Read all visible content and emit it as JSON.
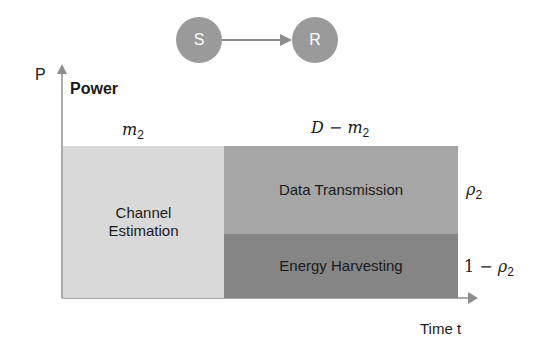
{
  "nodes": {
    "source": "S",
    "relay": "R"
  },
  "axes": {
    "y_symbol": "P",
    "y_label": "Power",
    "x_label": "Time t"
  },
  "intervals": {
    "first": {
      "var": "m",
      "sub": "2"
    },
    "second": {
      "prefix": "D − ",
      "var": "m",
      "sub": "2"
    }
  },
  "blocks": {
    "channel_estimation": "Channel Estimation",
    "data_transmission": "Data Transmission",
    "energy_harvesting": "Energy Harvesting"
  },
  "ratios": {
    "top": {
      "var": "ρ",
      "sub": "2"
    },
    "bottom": {
      "prefix": "1 − ",
      "var": "ρ",
      "sub": "2"
    }
  },
  "colors": {
    "node": "#9a9a9a",
    "channel_estimation": "#d9d9d9",
    "data_transmission": "#a6a6a6",
    "energy_harvesting": "#858585",
    "axis": "#8c8c8c"
  }
}
